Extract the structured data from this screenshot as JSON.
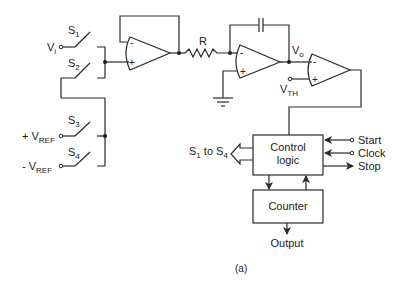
{
  "figure": {
    "caption": "(a)"
  },
  "inputs": {
    "vi": {
      "main": "V",
      "sub": "i"
    },
    "vref_pos": {
      "prefix": "+ ",
      "main": "V",
      "sub": "REF"
    },
    "vref_neg": {
      "prefix": "- ",
      "main": "V",
      "sub": "REF"
    }
  },
  "switches": [
    {
      "main": "S",
      "sub": "1"
    },
    {
      "main": "S",
      "sub": "2"
    },
    {
      "main": "S",
      "sub": "3"
    },
    {
      "main": "S",
      "sub": "4"
    }
  ],
  "components": {
    "resistor": "R",
    "vo": {
      "main": "V",
      "sub": "o"
    },
    "vth": {
      "main": "V",
      "sub": "TH"
    },
    "opamp_minus": "-",
    "opamp_plus": "+"
  },
  "blocks": {
    "control_line1": "Control",
    "control_line2": "logic",
    "counter": "Counter"
  },
  "signals": {
    "switch_bus": {
      "s": "S",
      "s1": "1",
      "to": " to ",
      "s4sub": "4"
    },
    "start": "Start",
    "clock": "Clock",
    "stop": "Stop",
    "output": "Output"
  }
}
